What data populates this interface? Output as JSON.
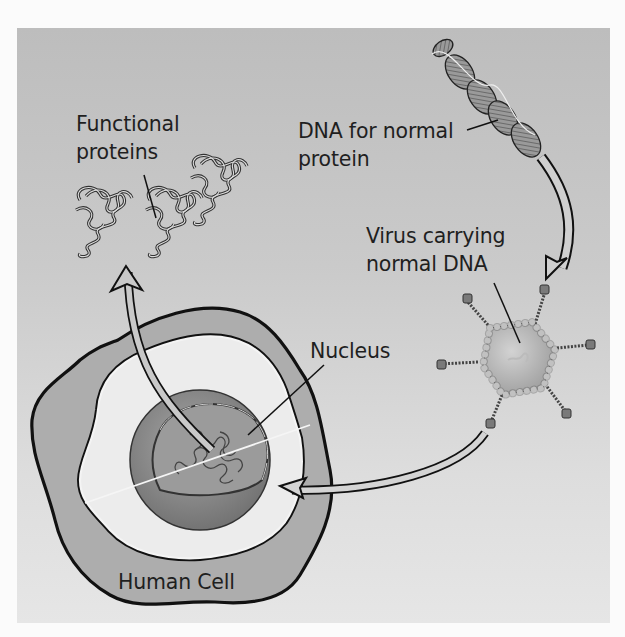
{
  "diagram": {
    "colors": {
      "background_panel": "#c6c6c6",
      "outline": "#111111",
      "cytoplasm": "#e8e8e8",
      "cell_membrane_band": "#a9a9a9",
      "nucleus": "#8a8a8a",
      "virus_capsid": "#b9b9b9",
      "arrow_fill": "#c9c9c9"
    },
    "labels": {
      "functional_proteins": {
        "line1": "Functional",
        "line2": "proteins"
      },
      "dna_normal": {
        "line1": "DNA for normal",
        "line2": "protein"
      },
      "virus": {
        "line1": "Virus carrying",
        "line2": "normal DNA"
      },
      "nucleus": "Nucleus",
      "human_cell": "Human Cell"
    },
    "elements": [
      {
        "id": "dna-helix",
        "description": "Double-stranded DNA for normal protein"
      },
      {
        "id": "arrow-dna-to-virus",
        "description": "DNA inserted into virus"
      },
      {
        "id": "virus",
        "description": "Virus carrying normal DNA",
        "spikes": 6
      },
      {
        "id": "arrow-virus-to-nucleus",
        "description": "Virus delivers DNA into the nucleus"
      },
      {
        "id": "human-cell",
        "description": "Human cell with nucleus"
      },
      {
        "id": "arrow-nucleus-to-proteins",
        "description": "Nucleus produces functional proteins"
      },
      {
        "id": "functional-proteins",
        "description": "Three folded protein molecules",
        "count": 3
      }
    ]
  }
}
